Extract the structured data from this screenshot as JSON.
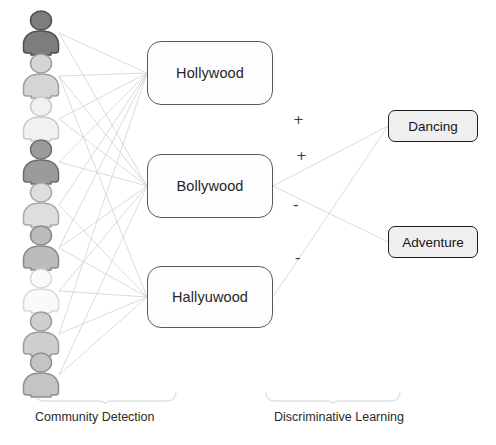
{
  "diagram": {
    "background_color": "#ffffff"
  },
  "users": {
    "icon_name": "person-icon",
    "count": 9,
    "nodes": [
      {
        "id": "user-1",
        "cx": 41,
        "cy": 33,
        "shade": "#7d7d7d",
        "outline": "#4f4f4f"
      },
      {
        "id": "user-2",
        "cx": 41,
        "cy": 76,
        "shade": "#d5d5d5",
        "outline": "#9e9e9e"
      },
      {
        "id": "user-3",
        "cx": 41,
        "cy": 119,
        "shade": "#f1f1f1",
        "outline": "#c9c9c9"
      },
      {
        "id": "user-4",
        "cx": 41,
        "cy": 162,
        "shade": "#9b9b9b",
        "outline": "#6e6e6e"
      },
      {
        "id": "user-5",
        "cx": 41,
        "cy": 205,
        "shade": "#dedede",
        "outline": "#a9a9a9"
      },
      {
        "id": "user-6",
        "cx": 41,
        "cy": 248,
        "shade": "#bcbcbc",
        "outline": "#8a8a8a"
      },
      {
        "id": "user-7",
        "cx": 41,
        "cy": 291,
        "shade": "#fafafa",
        "outline": "#d8d8d8"
      },
      {
        "id": "user-8",
        "cx": 41,
        "cy": 334,
        "shade": "#cfcfcf",
        "outline": "#9c9c9c"
      },
      {
        "id": "user-9",
        "cx": 41,
        "cy": 375,
        "shade": "#c4c4c4",
        "outline": "#8f8f8f"
      }
    ]
  },
  "communities": [
    {
      "id": "community-hollywood",
      "label": "Hollywood",
      "x": 147,
      "y": 41,
      "w": 126,
      "h": 64
    },
    {
      "id": "community-bollywood",
      "label": "Bollywood",
      "x": 147,
      "y": 154,
      "w": 126,
      "h": 64
    },
    {
      "id": "community-hallyuwood",
      "label": "Hallyuwood",
      "x": 147,
      "y": 266,
      "w": 126,
      "h": 62
    }
  ],
  "categories": [
    {
      "id": "category-dancing",
      "label": "Dancing",
      "x": 388,
      "y": 110,
      "w": 90,
      "h": 32
    },
    {
      "id": "category-adventure",
      "label": "Adventure",
      "x": 388,
      "y": 226,
      "w": 90,
      "h": 32
    }
  ],
  "signs": [
    {
      "id": "sign-plus-1",
      "text": "+",
      "x": 293,
      "y": 113
    },
    {
      "id": "sign-plus-2",
      "text": "+",
      "x": 296,
      "y": 149
    },
    {
      "id": "sign-minus-1",
      "text": "-",
      "x": 293,
      "y": 198
    },
    {
      "id": "sign-minus-2",
      "text": "-",
      "x": 295,
      "y": 251
    }
  ],
  "stages": [
    {
      "id": "stage-community-detection",
      "label": "Community Detection",
      "text_x": 35,
      "text_y": 410,
      "brace": {
        "left": 35,
        "right": 176,
        "top": 392,
        "point": 105,
        "bottom": 404
      }
    },
    {
      "id": "stage-discriminative-learning",
      "label": "Discriminative Learning",
      "text_x": 274,
      "text_y": 410,
      "brace": {
        "left": 266,
        "right": 400,
        "top": 392,
        "point": 333,
        "bottom": 404
      }
    }
  ],
  "edges": {
    "color": "#d6d6d6",
    "width": 0.9,
    "user_to_community": [
      {
        "from": "user-1",
        "to": "community-hollywood"
      },
      {
        "from": "user-1",
        "to": "community-bollywood"
      },
      {
        "from": "user-2",
        "to": "community-hollywood"
      },
      {
        "from": "user-2",
        "to": "community-bollywood"
      },
      {
        "from": "user-2",
        "to": "community-hallyuwood"
      },
      {
        "from": "user-3",
        "to": "community-hollywood"
      },
      {
        "from": "user-3",
        "to": "community-bollywood"
      },
      {
        "from": "user-4",
        "to": "community-hollywood"
      },
      {
        "from": "user-4",
        "to": "community-bollywood"
      },
      {
        "from": "user-5",
        "to": "community-hollywood"
      },
      {
        "from": "user-5",
        "to": "community-hallyuwood"
      },
      {
        "from": "user-6",
        "to": "community-hollywood"
      },
      {
        "from": "user-6",
        "to": "community-bollywood"
      },
      {
        "from": "user-6",
        "to": "community-hallyuwood"
      },
      {
        "from": "user-7",
        "to": "community-bollywood"
      },
      {
        "from": "user-7",
        "to": "community-hallyuwood"
      },
      {
        "from": "user-8",
        "to": "community-hollywood"
      },
      {
        "from": "user-8",
        "to": "community-hallyuwood"
      },
      {
        "from": "user-9",
        "to": "community-bollywood"
      },
      {
        "from": "user-9",
        "to": "community-hallyuwood"
      }
    ],
    "community_to_category": [
      {
        "from": "community-bollywood",
        "to": "category-dancing",
        "sign": "+"
      },
      {
        "from": "community-bollywood",
        "to": "category-adventure",
        "sign": "-"
      },
      {
        "from": "community-hallyuwood",
        "to": "category-dancing",
        "sign": "-"
      }
    ]
  }
}
